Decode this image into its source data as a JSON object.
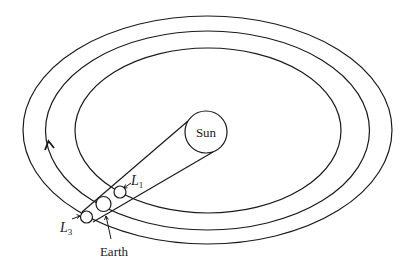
{
  "diagram": {
    "type": "orbital-diagram",
    "labels": {
      "sun": "Sun",
      "earth": "Earth",
      "l1_letter": "L",
      "l1_sub": "1",
      "l3_letter": "L",
      "l3_sub": "3"
    },
    "orbits": [
      {
        "name": "outer-orbit",
        "cx": 207.5,
        "cy": 130,
        "rx": 184.5,
        "ry": 114
      },
      {
        "name": "earth-orbit",
        "cx": 207.5,
        "cy": 130.5,
        "rx": 162,
        "ry": 99.5
      },
      {
        "name": "inner-orbit",
        "cx": 208,
        "cy": 130.5,
        "rx": 133,
        "ry": 82.5
      }
    ],
    "bodies": [
      {
        "name": "sun",
        "cx": 206,
        "cy": 132,
        "r": 21
      },
      {
        "name": "earth",
        "cx": 104,
        "cy": 203,
        "r": 7.5
      },
      {
        "name": "l1",
        "cx": 120,
        "cy": 192,
        "r": 6
      },
      {
        "name": "l3",
        "cx": 87,
        "cy": 217,
        "r": 6
      }
    ],
    "colors": {
      "line": "#1a1a1a",
      "background": "#ffffff"
    },
    "direction_arrow": "counter-clockwise"
  }
}
